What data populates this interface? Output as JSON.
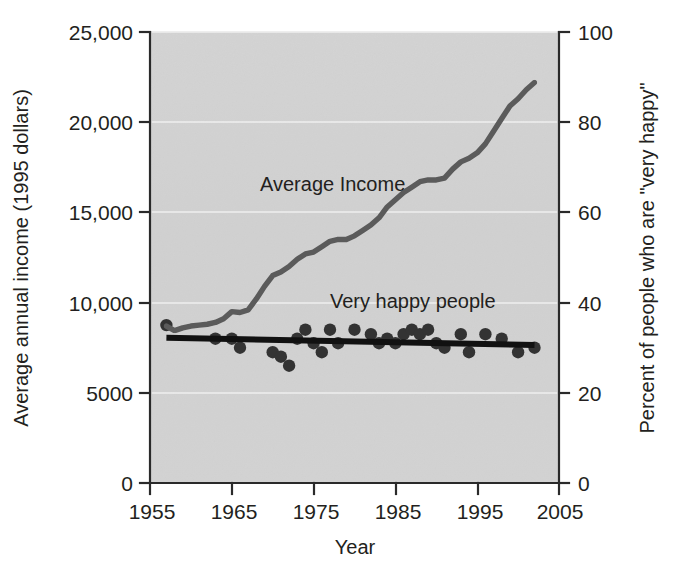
{
  "chart_data": {
    "type": "line",
    "title": "",
    "xlabel": "Year",
    "ylabel": "Average annual income (1995 dollars)",
    "y2label": "Percent of people who are \"very happy\"",
    "xlim": [
      1955,
      2005
    ],
    "ylim": [
      0,
      25000
    ],
    "y2lim": [
      0,
      100
    ],
    "grid": "horizontal-major-only",
    "legend_position": "inline-annotations",
    "plot_background": "#d5d5d5",
    "xticks": [
      "1955",
      "1965",
      "1975",
      "1985",
      "1995",
      "2005"
    ],
    "xtick_values": [
      1955,
      1965,
      1975,
      1985,
      1995,
      2005
    ],
    "yticks": [
      "0",
      "5000",
      "10,000",
      "15,000",
      "20,000",
      "25,000"
    ],
    "ytick_values": [
      0,
      5000,
      10000,
      15000,
      20000,
      25000
    ],
    "y2ticks": [
      "0",
      "20",
      "40",
      "60",
      "80",
      "100"
    ],
    "y2tick_values": [
      0,
      20,
      40,
      60,
      80,
      100
    ],
    "annotations": [
      {
        "text": "Average Income",
        "x": 1968.5,
        "y": 16200
      },
      {
        "text": "Very happy people",
        "x": 1977.0,
        "y": 9700
      }
    ],
    "series": [
      {
        "name": "Average Income",
        "type": "line",
        "color": "#5b5b5b",
        "axis": "left",
        "units": "1995 dollars",
        "x": [
          1957,
          1958,
          1959,
          1960,
          1961,
          1962,
          1963,
          1964,
          1965,
          1966,
          1967,
          1968,
          1969,
          1970,
          1971,
          1972,
          1973,
          1974,
          1975,
          1976,
          1977,
          1978,
          1979,
          1980,
          1981,
          1982,
          1983,
          1984,
          1985,
          1986,
          1987,
          1988,
          1989,
          1990,
          1991,
          1992,
          1993,
          1994,
          1995,
          1996,
          1997,
          1998,
          1999,
          2000,
          2001,
          2002
        ],
        "values": [
          8700,
          8450,
          8600,
          8700,
          8750,
          8800,
          8900,
          9100,
          9500,
          9450,
          9600,
          10200,
          10900,
          11500,
          11700,
          12000,
          12400,
          12700,
          12800,
          13100,
          13400,
          13500,
          13500,
          13700,
          14000,
          14300,
          14700,
          15300,
          15700,
          16100,
          16400,
          16700,
          16800,
          16800,
          16900,
          17400,
          17800,
          18000,
          18300,
          18800,
          19500,
          20200,
          20900,
          21300,
          21800,
          22200
        ]
      },
      {
        "name": "Very happy people",
        "type": "scatter",
        "color": "#333333",
        "axis": "right",
        "units": "percent",
        "x": [
          1957,
          1963,
          1965,
          1966,
          1970,
          1971,
          1972,
          1973,
          1974,
          1975,
          1976,
          1977,
          1978,
          1980,
          1982,
          1983,
          1984,
          1985,
          1986,
          1987,
          1988,
          1989,
          1990,
          1991,
          1993,
          1994,
          1996,
          1998,
          2000,
          2002
        ],
        "values": [
          35,
          32,
          32,
          30,
          29,
          28,
          26,
          32,
          34,
          31,
          29,
          34,
          31,
          34,
          33,
          31,
          32,
          31,
          33,
          34,
          33,
          34,
          31,
          30,
          33,
          29,
          33,
          32,
          29,
          30
        ]
      },
      {
        "name": "Very happy trend",
        "type": "line",
        "color": "#111111",
        "axis": "right",
        "x": [
          1957,
          2002
        ],
        "values": [
          32.2,
          30.6
        ]
      }
    ]
  }
}
